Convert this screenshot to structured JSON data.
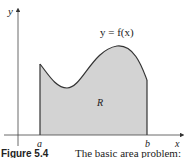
{
  "figure": {
    "curve_label": "y = f(x)",
    "region_label": "R",
    "axis_labels": {
      "x": "x",
      "y": "y"
    },
    "bounds": {
      "a": "a",
      "b": "b"
    },
    "caption": {
      "number": "Figure 5.4",
      "text": "The basic area problem:"
    },
    "colors": {
      "fill": "#d3d3d3",
      "stroke": "#333333",
      "axis": "#444444"
    }
  }
}
